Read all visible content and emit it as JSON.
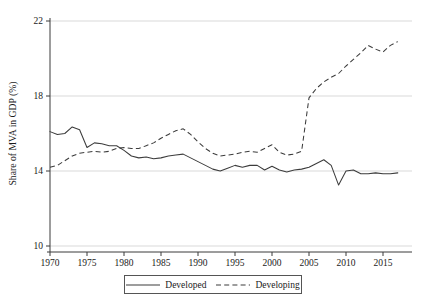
{
  "chart_data": {
    "type": "line",
    "title": "",
    "xlabel": "",
    "ylabel": "Share of MVA in GDP (%)",
    "xlim": [
      1969,
      2018
    ],
    "ylim": [
      10,
      22
    ],
    "yticks": [
      10,
      14,
      18,
      22
    ],
    "xticks": [
      1970,
      1975,
      1980,
      1985,
      1990,
      1995,
      2000,
      2005,
      2010,
      2015
    ],
    "ytick_labels": [
      "10",
      "14",
      "18",
      "22"
    ],
    "xtick_labels": [
      "1970",
      "1975",
      "1980",
      "1985",
      "1990",
      "1995",
      "2000",
      "2005",
      "2010",
      "2015"
    ],
    "grid": "horizontal",
    "legend_position": "bottom-center",
    "x": [
      1970,
      1971,
      1972,
      1973,
      1974,
      1975,
      1976,
      1977,
      1978,
      1979,
      1980,
      1981,
      1982,
      1983,
      1984,
      1985,
      1986,
      1987,
      1988,
      1989,
      1990,
      1991,
      1992,
      1993,
      1994,
      1995,
      1996,
      1997,
      1998,
      1999,
      2000,
      2001,
      2002,
      2003,
      2004,
      2005,
      2006,
      2007,
      2008,
      2009,
      2010,
      2011,
      2012,
      2013,
      2014,
      2015,
      2016,
      2017
    ],
    "series": [
      {
        "name": "Developed",
        "style": "solid",
        "color": "#3c3c3c",
        "values": [
          16.1,
          15.95,
          16.0,
          16.35,
          16.2,
          15.25,
          15.5,
          15.45,
          15.35,
          15.35,
          15.1,
          14.8,
          14.7,
          14.75,
          14.65,
          14.7,
          14.8,
          14.85,
          14.9,
          14.7,
          14.5,
          14.3,
          14.1,
          14.0,
          14.15,
          14.3,
          14.2,
          14.3,
          14.3,
          14.05,
          14.25,
          14.05,
          13.95,
          14.05,
          14.1,
          14.2,
          14.4,
          14.6,
          14.3,
          13.25,
          14.0,
          14.05,
          13.85,
          13.85,
          13.9,
          13.85,
          13.85,
          13.9
        ]
      },
      {
        "name": "Developing",
        "style": "dashed",
        "color": "#3c3c3c",
        "values": [
          14.2,
          14.3,
          14.55,
          14.8,
          14.95,
          15.0,
          15.05,
          15.0,
          15.05,
          15.2,
          15.25,
          15.2,
          15.2,
          15.35,
          15.5,
          15.75,
          15.95,
          16.15,
          16.25,
          15.95,
          15.55,
          15.2,
          14.95,
          14.8,
          14.85,
          14.9,
          15.0,
          15.05,
          15.0,
          15.2,
          15.4,
          15.0,
          14.85,
          14.9,
          15.05,
          17.9,
          18.4,
          18.75,
          19.0,
          19.2,
          19.6,
          19.95,
          20.3,
          20.7,
          20.5,
          20.35,
          20.7,
          20.9
        ]
      }
    ]
  },
  "legend": {
    "items": [
      {
        "label": "Developed",
        "style": "solid"
      },
      {
        "label": "Developing",
        "style": "dashed"
      }
    ]
  }
}
